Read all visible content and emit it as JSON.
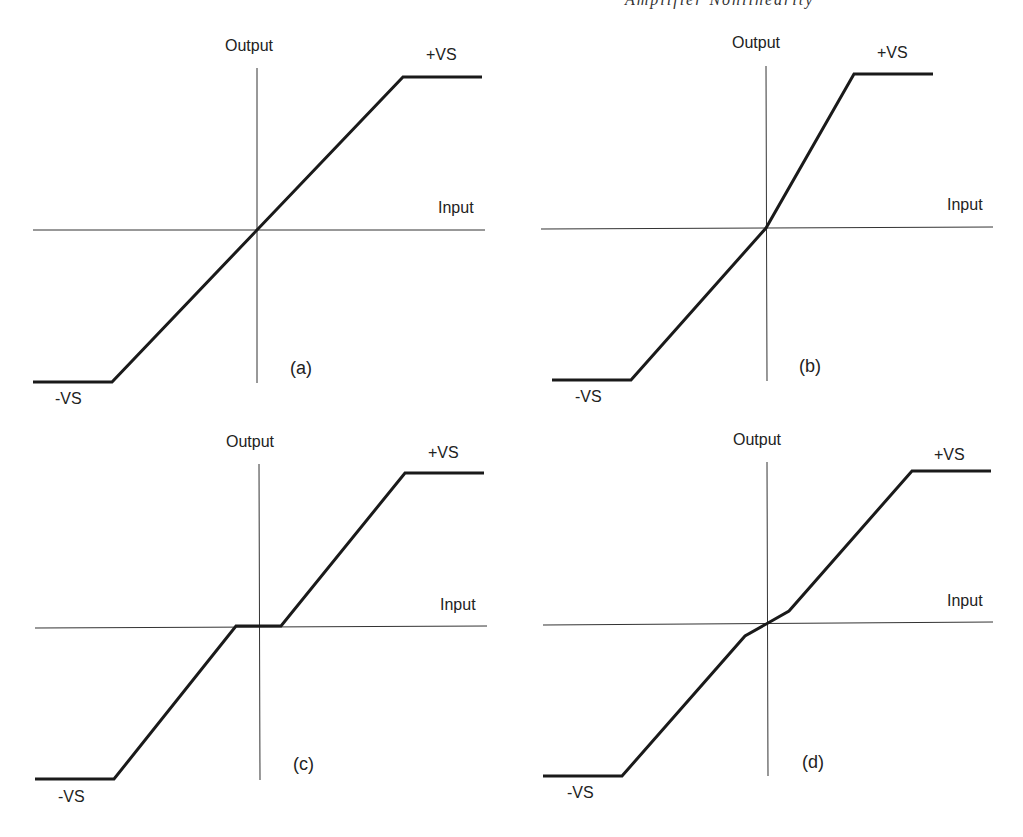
{
  "header": {
    "fragment": "Amplifier Nonlinearity"
  },
  "chart_data": [
    {
      "type": "line",
      "panel": "(a)",
      "title": "Linear with symmetric saturation",
      "xlabel": "Input",
      "ylabel": "Output",
      "annotations": [
        "+VS",
        "-VS"
      ],
      "points": [
        [
          -1.0,
          -1.0
        ],
        [
          -0.65,
          -1.0
        ],
        [
          0.65,
          1.0
        ],
        [
          1.0,
          1.0
        ]
      ]
    },
    {
      "type": "line",
      "panel": "(b)",
      "title": "Asymmetric gain with saturation",
      "xlabel": "Input",
      "ylabel": "Output",
      "annotations": [
        "+VS",
        "-VS"
      ],
      "points": [
        [
          -1.0,
          -1.0
        ],
        [
          -0.6,
          -1.0
        ],
        [
          0.0,
          0.0
        ],
        [
          0.39,
          1.0
        ],
        [
          0.74,
          1.0
        ]
      ]
    },
    {
      "type": "line",
      "panel": "(c)",
      "title": "Dead zone (crossover) with saturation",
      "xlabel": "Input",
      "ylabel": "Output",
      "annotations": [
        "+VS",
        "-VS"
      ],
      "points": [
        [
          -1.0,
          -1.0
        ],
        [
          -0.65,
          -1.0
        ],
        [
          -0.1,
          0.0
        ],
        [
          0.1,
          0.0
        ],
        [
          0.65,
          1.0
        ],
        [
          1.0,
          1.0
        ]
      ]
    },
    {
      "type": "line",
      "panel": "(d)",
      "title": "Reduced gain near zero with saturation",
      "xlabel": "Input",
      "ylabel": "Output",
      "annotations": [
        "+VS",
        "-VS"
      ],
      "points": [
        [
          -1.0,
          -1.0
        ],
        [
          -0.65,
          -1.0
        ],
        [
          -0.1,
          -0.09
        ],
        [
          0.0,
          0.0
        ],
        [
          0.1,
          0.08
        ],
        [
          0.65,
          1.0
        ],
        [
          1.0,
          1.0
        ]
      ]
    }
  ],
  "panels": [
    {
      "tag": "(a)",
      "ylabel": "Output",
      "xlabel": "Input",
      "pos": "+VS",
      "neg": "-VS",
      "xaxis": [
        33,
        230,
        485,
        230
      ],
      "yaxis": [
        257,
        68,
        257,
        383
      ],
      "curve": "33,382 112,382 403,77 482,77",
      "ylabel_xy": [
        225,
        51
      ],
      "xlabel_xy": [
        438,
        213
      ],
      "pos_xy": [
        426,
        60
      ],
      "neg_xy": [
        55,
        404
      ],
      "tag_xy": [
        290,
        374
      ]
    },
    {
      "tag": "(b)",
      "ylabel": "Output",
      "xlabel": "Input",
      "pos": "+VS",
      "neg": "-VS",
      "xaxis": [
        541,
        229,
        993,
        227
      ],
      "yaxis": [
        766,
        66,
        767,
        381
      ],
      "curve": "552,380 631,380 766,228 854,74 933,74",
      "ylabel_xy": [
        732,
        48
      ],
      "xlabel_xy": [
        947,
        210
      ],
      "pos_xy": [
        877,
        58
      ],
      "neg_xy": [
        575,
        402
      ],
      "tag_xy": [
        799,
        372
      ]
    },
    {
      "tag": "(c)",
      "ylabel": "Output",
      "xlabel": "Input",
      "pos": "+VS",
      "neg": "-VS",
      "xaxis": [
        35,
        628,
        487,
        626
      ],
      "yaxis": [
        259,
        464,
        260,
        780
      ],
      "curve": "35,779 114,779 236,626 281,626 405,473 484,473",
      "ylabel_xy": [
        226,
        447
      ],
      "xlabel_xy": [
        440,
        610
      ],
      "pos_xy": [
        428,
        458
      ],
      "neg_xy": [
        58,
        802
      ],
      "tag_xy": [
        293,
        770
      ]
    },
    {
      "tag": "(d)",
      "ylabel": "Output",
      "xlabel": "Input",
      "pos": "+VS",
      "neg": "-VS",
      "xaxis": [
        543,
        625,
        993,
        622
      ],
      "yaxis": [
        767,
        462,
        768,
        776
      ],
      "curve": "543,776 622,776 745,636 768,623 789,611 912,471 991,471",
      "ylabel_xy": [
        733,
        445
      ],
      "xlabel_xy": [
        947,
        606
      ],
      "pos_xy": [
        934,
        460
      ],
      "neg_xy": [
        567,
        798
      ],
      "tag_xy": [
        802,
        768
      ]
    }
  ]
}
